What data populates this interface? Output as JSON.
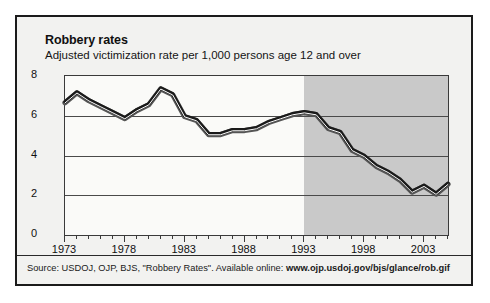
{
  "card": {
    "title": "Robbery rates",
    "subtitle": "Adjusted victimization rate per 1,000 persons age 12 and over",
    "source_prefix": "Source: USDOJ, OJP, BJS, \"Robbery Rates\". Available online: ",
    "source_url": "www.ojp.usdoj.gov/bjs/glance/rob.gif"
  },
  "colors": {
    "line": "#1a1a1a",
    "line_highlight": "#ffffff",
    "shaded_region": "#c9c9c9",
    "plot_background": "#fafaf8",
    "card_background": "#f2f2f0",
    "frame_border": "#1b1b1b",
    "gridline": "#4a4a4a"
  },
  "chart_data": {
    "type": "line",
    "title": "Robbery rates",
    "subtitle": "Adjusted victimization rate per 1,000 persons age 12 and over",
    "xlabel": "",
    "ylabel": "Rate per 1,000 persons age 12 and over",
    "xlim": [
      1973,
      2005
    ],
    "ylim": [
      0,
      8
    ],
    "yticks": [
      0,
      2,
      4,
      6,
      8
    ],
    "ytick_labels": [
      "0",
      "2",
      "4",
      "6",
      "8"
    ],
    "xticks": [
      1973,
      1978,
      1983,
      1988,
      1993,
      1998,
      2003
    ],
    "xtick_labels": [
      "1973",
      "1978",
      "1983",
      "1988",
      "1993",
      "1998",
      "2003"
    ],
    "minor_xtick_interval": 1,
    "grid": "horizontal",
    "legend": "none",
    "shaded_region": {
      "from": 1993,
      "to": 2005,
      "label": ""
    },
    "x": [
      1973,
      1974,
      1975,
      1976,
      1977,
      1978,
      1979,
      1980,
      1981,
      1982,
      1983,
      1984,
      1985,
      1986,
      1987,
      1988,
      1989,
      1990,
      1991,
      1992,
      1993,
      1994,
      1995,
      1996,
      1997,
      1998,
      1999,
      2000,
      2001,
      2002,
      2003,
      2004,
      2005
    ],
    "values": [
      6.7,
      7.2,
      6.8,
      6.5,
      6.2,
      5.9,
      6.3,
      6.6,
      7.4,
      7.1,
      6.0,
      5.8,
      5.1,
      5.1,
      5.3,
      5.3,
      5.4,
      5.7,
      5.9,
      6.1,
      6.2,
      6.1,
      5.4,
      5.2,
      4.3,
      4.0,
      3.5,
      3.2,
      2.8,
      2.2,
      2.5,
      2.1,
      2.6
    ],
    "series": [
      {
        "name": "Adjusted victimization rate per 1,000",
        "values": [
          6.7,
          7.2,
          6.8,
          6.5,
          6.2,
          5.9,
          6.3,
          6.6,
          7.4,
          7.1,
          6.0,
          5.8,
          5.1,
          5.1,
          5.3,
          5.3,
          5.4,
          5.7,
          5.9,
          6.1,
          6.2,
          6.1,
          5.4,
          5.2,
          4.3,
          4.0,
          3.5,
          3.2,
          2.8,
          2.2,
          2.5,
          2.1,
          2.6
        ]
      }
    ]
  }
}
